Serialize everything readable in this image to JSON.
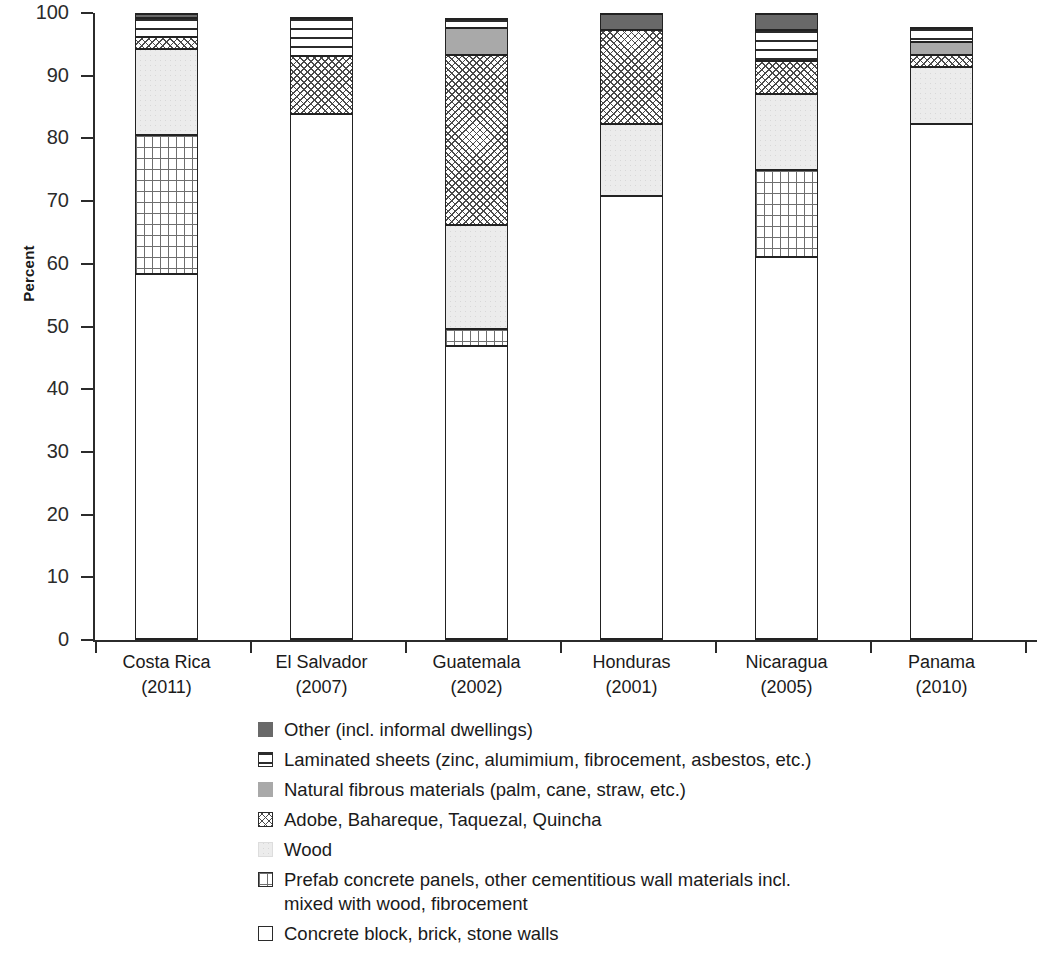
{
  "chart_data": {
    "type": "bar",
    "subtype": "stacked-bar-100-percent",
    "title": "",
    "xlabel": "",
    "ylabel": "Percent",
    "ylim": [
      0,
      100
    ],
    "yticks": [
      0,
      10,
      20,
      30,
      40,
      50,
      60,
      70,
      80,
      90,
      100
    ],
    "ytick_labels": [
      "0",
      "10",
      "20",
      "30",
      "40",
      "50",
      "60",
      "70",
      "80",
      "90",
      "100"
    ],
    "grid": false,
    "legend_position": "below-plot",
    "categories": [
      "Costa Rica\n(2011)",
      "El Salvador\n(2007)",
      "Guatemala\n(2002)",
      "Honduras\n(2001)",
      "Nicaragua\n(2005)",
      "Panama\n(2010)"
    ],
    "category_names": [
      "Costa Rica",
      "El Salvador",
      "Guatemala",
      "Honduras",
      "Nicaragua",
      "Panama"
    ],
    "category_years": [
      "(2011)",
      "(2007)",
      "(2002)",
      "(2001)",
      "(2005)",
      "(2010)"
    ],
    "series": [
      {
        "name": "Concrete block, brick, stone walls",
        "key": "concrete",
        "pattern": "white-fill-outline",
        "values": [
          58.6,
          84.0,
          47.0,
          71.0,
          61.3,
          82.5
        ]
      },
      {
        "name": "Prefab concrete panels, other cementitious wall materials incl. mixed with wood, fibrocement",
        "key": "prefab",
        "pattern": "fine-grid",
        "values": [
          22.1,
          0.0,
          2.7,
          0.0,
          13.9,
          0.0
        ]
      },
      {
        "name": "Wood",
        "key": "wood",
        "pattern": "light-stipple",
        "values": [
          13.8,
          0.0,
          16.7,
          11.4,
          12.1,
          9.0
        ]
      },
      {
        "name": "Adobe, Bahareque, Taquezal, Quincha",
        "key": "adobe",
        "pattern": "cross-hatch-diamond",
        "values": [
          1.9,
          9.3,
          27.0,
          15.0,
          5.2,
          1.9
        ]
      },
      {
        "name": "Natural fibrous materials (palm, cane, straw, etc.)",
        "key": "fibrous",
        "pattern": "solid-light-gray",
        "values": [
          0.0,
          0.0,
          4.3,
          0.0,
          0.0,
          2.2
        ]
      },
      {
        "name": "Laminated sheets (zinc, alumimium, fibrocement, asbestos, etc.)",
        "key": "laminated",
        "pattern": "horizontal-lines",
        "values": [
          3.0,
          6.0,
          1.5,
          0.0,
          5.0,
          2.2
        ]
      },
      {
        "name": "Other (incl. informal dwellings)",
        "key": "other",
        "pattern": "solid-dark-gray",
        "values": [
          0.6,
          0.0,
          0.0,
          2.6,
          2.5,
          0.0
        ]
      }
    ],
    "stack_order_bottom_to_top": [
      "concrete",
      "prefab",
      "wood",
      "adobe",
      "fibrous",
      "laminated",
      "other"
    ],
    "colors": {
      "other": "#696969",
      "fibrous": "#a9a9a9",
      "wood": "#ececec",
      "adobe": "#ffffff",
      "laminated": "#ffffff",
      "prefab": "#ffffff",
      "concrete": "#ffffff",
      "outline": "#2b2b2b",
      "axis": "#2b2b2b",
      "text": "#1a1a1a"
    }
  },
  "axis": {
    "ylabel": "Percent",
    "ytick_labels": [
      "100",
      "90",
      "80",
      "70",
      "60",
      "50",
      "40",
      "30",
      "20",
      "10",
      "0"
    ]
  },
  "legend": {
    "items": [
      {
        "swatch": "other",
        "label": "Other (incl. informal dwellings)"
      },
      {
        "swatch": "laminated",
        "label": "Laminated sheets (zinc, alumimium, fibrocement, asbestos, etc.)"
      },
      {
        "swatch": "fibrous",
        "label": "Natural fibrous materials (palm, cane, straw, etc.)"
      },
      {
        "swatch": "adobe",
        "label": "Adobe, Bahareque, Taquezal, Quincha"
      },
      {
        "swatch": "wood",
        "label": "Wood"
      },
      {
        "swatch": "prefab",
        "label": "Prefab concrete panels, other cementitious wall materials incl. mixed with wood, fibrocement"
      },
      {
        "swatch": "concrete",
        "label": "Concrete block, brick, stone walls"
      }
    ]
  }
}
